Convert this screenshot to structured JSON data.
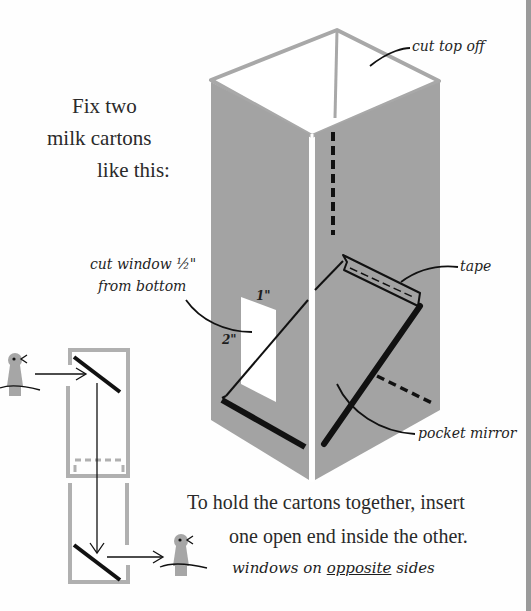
{
  "intro": {
    "line1": "Fix two",
    "line2": "milk cartons",
    "line3": "like this:"
  },
  "labels": {
    "cut_top": "cut top off",
    "cut_window_line1": "cut window ½\"",
    "cut_window_line2": "from bottom",
    "dim_width": "1\"",
    "dim_height": "2\"",
    "tape": "tape",
    "pocket_mirror": "pocket mirror"
  },
  "instructions": {
    "line1": "To hold the cartons together, insert",
    "line2": "one open end inside the other.",
    "note_prefix": "windows on ",
    "note_emphasis": "opposite",
    "note_suffix": " sides"
  },
  "colors": {
    "carton_gray": "#a3a3a3",
    "outline_gray": "#b0b0b0",
    "ink": "#1a1a1a",
    "figure_gray": "#a6a6a6",
    "stripe": "#9a9a9a"
  }
}
